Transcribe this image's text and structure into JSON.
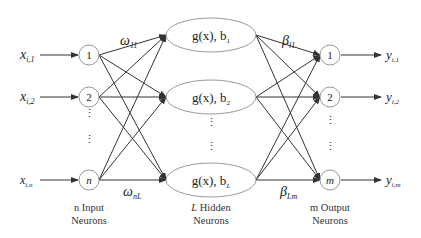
{
  "diagram": {
    "type": "neural-network",
    "input_layer": {
      "caption_line1": "n Input",
      "caption_line2": "Neurons",
      "nodes": [
        {
          "label": "1",
          "input": "x",
          "input_sub": "i,1"
        },
        {
          "label": "2",
          "input": "x",
          "input_sub": "i,2"
        },
        {
          "label": "n",
          "input": "x",
          "input_sub": "i,n"
        }
      ]
    },
    "hidden_layer": {
      "caption_line1_var": "L",
      "caption_line1_text": " Hidden",
      "caption_line2": "Neurons",
      "nodes": [
        {
          "func": "g(x), b",
          "sub": "1"
        },
        {
          "func": "g(x), b",
          "sub": "2"
        },
        {
          "func": "g(x), b",
          "sub": "L"
        }
      ]
    },
    "output_layer": {
      "caption_line1": "m Output",
      "caption_line2": "Neurons",
      "nodes": [
        {
          "label": "1",
          "output": "y",
          "output_sub": "i,1"
        },
        {
          "label": "2",
          "output": "y",
          "output_sub": "i,2"
        },
        {
          "label": "m",
          "output": "y",
          "output_sub": "i,m"
        }
      ]
    },
    "weights": {
      "input_first": {
        "symbol": "ω",
        "sub": "11"
      },
      "input_last": {
        "symbol": "ω",
        "sub": "nL"
      },
      "output_first": {
        "symbol": "β",
        "sub": "l1"
      },
      "output_last": {
        "symbol": "β",
        "sub": "Lm"
      }
    },
    "ellipsis": "⋮"
  }
}
